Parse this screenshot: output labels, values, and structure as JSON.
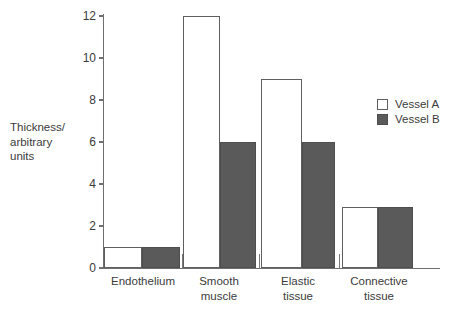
{
  "chart_data": {
    "type": "bar",
    "title": "",
    "xlabel": "",
    "ylabel": "Thickness/\narbitrary\nunits",
    "categories": [
      "Endothelium",
      "Smooth\nmuscle",
      "Elastic\ntissue",
      "Connective\ntissue"
    ],
    "series": [
      {
        "name": "Vessel A",
        "values": [
          1,
          12,
          9,
          2.9
        ],
        "color": "#ffffff"
      },
      {
        "name": "Vessel B",
        "values": [
          1,
          6,
          6,
          2.9
        ],
        "color": "#5a5a5a"
      }
    ],
    "ylim": [
      0,
      12
    ],
    "ytick_labels": [
      "12",
      "10",
      "8",
      "6",
      "4",
      "2",
      "0"
    ],
    "ytick_values": [
      12,
      10,
      8,
      6,
      4,
      2,
      0
    ],
    "grid": false,
    "legend_position": "right"
  },
  "legend": {
    "entries": [
      {
        "label": "Vessel A",
        "swatch": "open-square-swatch"
      },
      {
        "label": "Vessel B",
        "swatch": "filled-square-swatch"
      }
    ]
  },
  "axes": {
    "y_title": "Thickness/\narbitrary\nunits",
    "axis_color": "#6f6f6f",
    "text_color": "#3b3b3b"
  }
}
